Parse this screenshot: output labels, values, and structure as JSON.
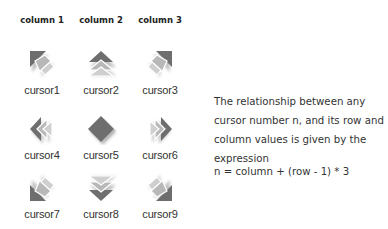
{
  "columns": [
    {
      "label": "column 1"
    },
    {
      "label": "column 2"
    },
    {
      "label": "column 3"
    }
  ],
  "cursors": [
    {
      "label": "cursor1",
      "icon": "arrow-up-left-icon",
      "row": 1,
      "column": 1
    },
    {
      "label": "cursor2",
      "icon": "arrow-up-icon",
      "row": 1,
      "column": 2
    },
    {
      "label": "cursor3",
      "icon": "arrow-up-right-icon",
      "row": 1,
      "column": 3
    },
    {
      "label": "cursor4",
      "icon": "arrow-left-icon",
      "row": 2,
      "column": 1
    },
    {
      "label": "cursor5",
      "icon": "diamond-center-icon",
      "row": 2,
      "column": 2
    },
    {
      "label": "cursor6",
      "icon": "arrow-right-icon",
      "row": 2,
      "column": 3
    },
    {
      "label": "cursor7",
      "icon": "arrow-down-left-icon",
      "row": 3,
      "column": 1
    },
    {
      "label": "cursor8",
      "icon": "arrow-down-icon",
      "row": 3,
      "column": 2
    },
    {
      "label": "cursor9",
      "icon": "arrow-down-right-icon",
      "row": 3,
      "column": 3
    }
  ],
  "description": {
    "text": "The relationship between any cursor number n, and its row and column values is given by the expression",
    "formula": "n = column + (row - 1) * 3"
  },
  "colors": {
    "icon_dark": "#6e6e6e",
    "icon_light": "#b4b4b4",
    "text": "#333333"
  }
}
